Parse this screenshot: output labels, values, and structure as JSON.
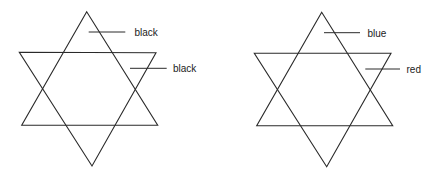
{
  "diagram": {
    "stars": [
      {
        "id": "left",
        "up_triangle": {
          "points": [
            [
              86.7,
              11.7
            ],
            [
              21.7,
              125.3
            ],
            [
              157.7,
              125.3
            ]
          ],
          "label": "black"
        },
        "down_triangle": {
          "points": [
            [
              19.3,
              52.3
            ],
            [
              156,
              52.7
            ],
            [
              92,
              166
            ]
          ],
          "label": "black"
        },
        "labels": [
          {
            "text": "black",
            "line": [
              [
                88.7,
                32
              ],
              [
                125.3,
                32
              ]
            ],
            "text_pos": [
              134.5,
              36
            ]
          },
          {
            "text": "black",
            "line": [
              [
                130,
                68.3
              ],
              [
                166.7,
                68.3
              ]
            ],
            "text_pos": [
              173,
              72
            ]
          }
        ]
      },
      {
        "id": "right",
        "up_triangle": {
          "points": [
            [
              321.7,
              12.3
            ],
            [
              256.7,
              125.7
            ],
            [
              392.7,
              125.7
            ]
          ],
          "label": "blue"
        },
        "down_triangle": {
          "points": [
            [
              254.3,
              53.3
            ],
            [
              391,
              53.3
            ],
            [
              326.7,
              166.7
            ]
          ],
          "label": "red"
        },
        "labels": [
          {
            "text": "blue",
            "line": [
              [
                324,
                32.7
              ],
              [
                360,
                32.7
              ]
            ],
            "text_pos": [
              367.5,
              36.5
            ]
          },
          {
            "text": "red",
            "line": [
              [
                365.3,
                69
              ],
              [
                400,
                69
              ]
            ],
            "text_pos": [
              406.5,
              72.5
            ]
          }
        ]
      }
    ]
  }
}
